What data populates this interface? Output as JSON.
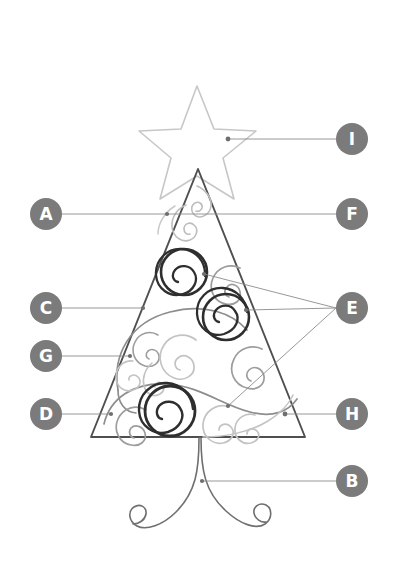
{
  "diagram": {
    "background_color": "#ffffff",
    "callout_fill_color": "#7b7b7b",
    "callout_text_color": "#ffffff",
    "leader_line_color": "#8c8c8c",
    "outline_dark_color": "#4a4a4a",
    "swirl_mid_color": "#9a9a9a",
    "swirl_light_color": "#c3c3c3",
    "star_color": "#c9c9c9"
  },
  "callouts": [
    {
      "id": "A",
      "label": "A",
      "side": "left",
      "top": 198,
      "target": "tree-outline-left-edge"
    },
    {
      "id": "C",
      "label": "C",
      "side": "left",
      "top": 292,
      "target": "tree-outline-left-edge-mid"
    },
    {
      "id": "G",
      "label": "G",
      "side": "left",
      "top": 340,
      "target": "light-swirl-left"
    },
    {
      "id": "D",
      "label": "D",
      "side": "left",
      "top": 398,
      "target": "mid-swirl-bottom-left"
    },
    {
      "id": "I",
      "label": "I",
      "side": "right",
      "top": 123,
      "target": "star-outline"
    },
    {
      "id": "F",
      "label": "F",
      "side": "right",
      "top": 198,
      "target": "light-swirl-top"
    },
    {
      "id": "E",
      "label": "E",
      "side": "right",
      "top": 292,
      "target": "dark-swirls"
    },
    {
      "id": "H",
      "label": "H",
      "side": "right",
      "top": 398,
      "target": "mid-swirl-bottom-right"
    },
    {
      "id": "B",
      "label": "B",
      "side": "right",
      "top": 465,
      "target": "tree-trunk"
    }
  ],
  "leader_lines": [
    {
      "from": "A",
      "x1": 62,
      "y1": 214,
      "x2": 167,
      "y2": 214
    },
    {
      "from": "F",
      "x1": 336,
      "y1": 214,
      "x2": 167,
      "y2": 214
    },
    {
      "from": "C",
      "x1": 62,
      "y1": 308,
      "x2": 143,
      "y2": 308
    },
    {
      "from": "G",
      "x1": 62,
      "y1": 356,
      "x2": 130,
      "y2": 356
    },
    {
      "from": "D",
      "x1": 62,
      "y1": 414,
      "x2": 111,
      "y2": 414
    },
    {
      "from": "I",
      "x1": 336,
      "y1": 139,
      "x2": 228,
      "y2": 139
    },
    {
      "from": "H",
      "x1": 336,
      "y1": 414,
      "x2": 285,
      "y2": 414
    },
    {
      "from": "B",
      "x1": 336,
      "y1": 481,
      "x2": 202,
      "y2": 481
    },
    {
      "from": "E",
      "x1": 336,
      "y1": 308,
      "x2": 204,
      "y2": 274
    },
    {
      "from": "E",
      "x1": 336,
      "y1": 308,
      "x2": 246,
      "y2": 310
    },
    {
      "from": "E",
      "x1": 336,
      "y1": 308,
      "x2": 228,
      "y2": 406
    }
  ],
  "shape_labels": {
    "star": "star-topper",
    "tree": "tree-triangle-outline",
    "trunk": "tree-trunk-curls",
    "dark_swirl_upper": "dark-swirl-upper",
    "dark_swirl_middle": "dark-swirl-middle",
    "dark_swirl_lower": "dark-swirl-lower"
  }
}
